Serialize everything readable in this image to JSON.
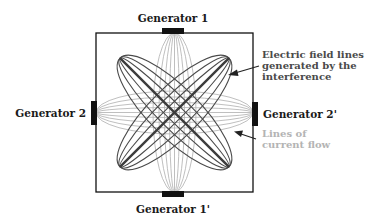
{
  "diagram": {
    "generators": {
      "top": "Generator 1",
      "bottom": "Generator 1'",
      "left": "Generator 2",
      "right": "Generator 2'"
    },
    "annotations": {
      "field_lines": [
        "Electric field lines",
        "generated by the",
        "interference"
      ],
      "current_flow": [
        "Lines of",
        "current flow"
      ]
    },
    "colors": {
      "field_lines": "#4a4a4a",
      "current_lines": "#b8b8b8",
      "box": "#111111"
    }
  }
}
